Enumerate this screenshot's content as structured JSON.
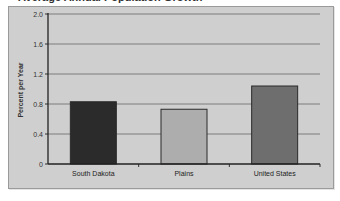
{
  "chart_data": {
    "type": "bar",
    "title": "Average Annual Population Growth",
    "xlabel": "",
    "ylabel": "Percent per Year",
    "categories": [
      "South Dakota",
      "Plains",
      "United States"
    ],
    "values": [
      0.83,
      0.73,
      1.04
    ],
    "colors": [
      "#2b2b2b",
      "#adadad",
      "#6e6e6e"
    ],
    "ylim": [
      0,
      2.0
    ],
    "yticks": [
      "0",
      "0.4",
      "0.8",
      "1.2",
      "1.6",
      "2.0"
    ],
    "grid": true,
    "legend": "none"
  }
}
